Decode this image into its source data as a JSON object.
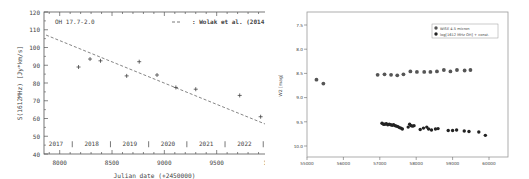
{
  "chart_data": [
    {
      "type": "scatter",
      "title": "OH 17.7-2.0",
      "xlabel": "Julian date (+2450000)",
      "ylabel": "S(1612MHz) [Jy*km/s]",
      "xlim": [
        7850,
        10000
      ],
      "ylim": [
        40,
        120
      ],
      "xticks": [
        8000,
        8500,
        9000,
        9500,
        10000
      ],
      "xtick_labels": [
        "8000",
        "8500",
        "9000",
        "9500",
        "100"
      ],
      "yticks": [
        40,
        50,
        60,
        70,
        80,
        90,
        100,
        110,
        120
      ],
      "grid": false,
      "marker": "plus",
      "series": [
        {
          "name": "observations",
          "x": [
            8180,
            8290,
            8390,
            8640,
            8760,
            8930,
            9110,
            9300,
            9720,
            9920
          ],
          "y": [
            89,
            93.5,
            92.5,
            84,
            92,
            84.5,
            77.5,
            76.5,
            73,
            61
          ]
        },
        {
          "name": "Wolak et al. (2014)",
          "style": "dashed",
          "x": [
            7870,
            10000
          ],
          "y": [
            107,
            56
          ]
        }
      ],
      "legend": [
        {
          "label": ": Wolak et al. (2014)",
          "style": "dashed"
        }
      ],
      "legend_position": "upper right",
      "year_annotations": [
        "2017",
        "2018",
        "2019",
        "2020",
        "2021",
        "2022"
      ],
      "year_boundaries_x": [
        8120,
        8485,
        8850,
        9215,
        9580,
        9945
      ]
    },
    {
      "type": "scatter",
      "title": "",
      "xlabel": "",
      "ylabel": "W2 [mag]",
      "xlim": [
        55000,
        60400
      ],
      "ylim": [
        10.25,
        7.25
      ],
      "y_inverted": true,
      "xticks": [
        55000,
        56000,
        57000,
        58000,
        59000,
        60000
      ],
      "yticks": [
        7.5,
        8.0,
        8.5,
        9.0,
        9.5,
        10.0
      ],
      "grid": false,
      "legend_position": "upper right",
      "series": [
        {
          "name": "WISE 4.5 micron",
          "color": "#555555",
          "x": [
            55260,
            55450,
            56940,
            57130,
            57310,
            57480,
            57650,
            57840,
            58020,
            58220,
            58390,
            58570,
            58760,
            58940,
            59120,
            59330,
            59490
          ],
          "y": [
            8.63,
            8.71,
            8.53,
            8.52,
            8.53,
            8.54,
            8.52,
            8.46,
            8.47,
            8.47,
            8.47,
            8.46,
            8.43,
            8.46,
            8.43,
            8.44,
            8.43
          ]
        },
        {
          "name": "log[1612 MHz OH] + const.",
          "color": "#222222",
          "x": [
            57060,
            57100,
            57140,
            57180,
            57220,
            57260,
            57300,
            57340,
            57380,
            57420,
            57460,
            57500,
            57540,
            57580,
            57620,
            57780,
            57820,
            57860,
            57900,
            57940,
            58110,
            58200,
            58290,
            58340,
            58420,
            58530,
            58600,
            58880,
            59000,
            59110,
            59320,
            59450,
            59720,
            59900
          ],
          "y": [
            9.53,
            9.55,
            9.55,
            9.54,
            9.56,
            9.55,
            9.56,
            9.57,
            9.56,
            9.58,
            9.59,
            9.6,
            9.62,
            9.63,
            9.65,
            9.61,
            9.55,
            9.58,
            9.59,
            9.58,
            9.66,
            9.63,
            9.61,
            9.65,
            9.67,
            9.65,
            9.64,
            9.68,
            9.68,
            9.67,
            9.69,
            9.7,
            9.71,
            9.78
          ]
        }
      ]
    }
  ],
  "left": {
    "object_label": "OH 17.7-2.0",
    "legend_label": ": Wolak et al. (2014)",
    "xlabel": "Julian date (+2450000)",
    "ylabel": "S(1612MHz) [Jy*km/s]"
  },
  "right": {
    "ylabel": "W2 [mag]",
    "legend": [
      "WISE 4.5 micron",
      "log[1612 MHz OH] + const."
    ]
  }
}
